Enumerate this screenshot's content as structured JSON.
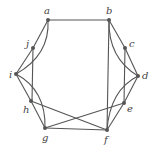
{
  "graph": {
    "vertices": [
      {
        "id": "a",
        "label": "a",
        "x": 48,
        "y": 20,
        "lx": 44,
        "ly": 14
      },
      {
        "id": "b",
        "label": "b",
        "x": 109,
        "y": 20,
        "lx": 106,
        "ly": 14
      },
      {
        "id": "c",
        "label": "c",
        "x": 125,
        "y": 48,
        "lx": 129,
        "ly": 47
      },
      {
        "id": "d",
        "label": "d",
        "x": 138,
        "y": 76,
        "lx": 142,
        "ly": 79
      },
      {
        "id": "e",
        "label": "e",
        "x": 124,
        "y": 103,
        "lx": 127,
        "ly": 112
      },
      {
        "id": "f",
        "label": "f",
        "x": 107,
        "y": 130,
        "lx": 104,
        "ly": 143
      },
      {
        "id": "g",
        "label": "g",
        "x": 45,
        "y": 128,
        "lx": 42,
        "ly": 141
      },
      {
        "id": "h",
        "label": "h",
        "x": 31,
        "y": 101,
        "lx": 23,
        "ly": 113
      },
      {
        "id": "i",
        "label": "i",
        "x": 16,
        "y": 74,
        "lx": 9,
        "ly": 78
      },
      {
        "id": "j",
        "label": "j",
        "x": 33,
        "y": 48,
        "lx": 26,
        "ly": 47
      }
    ],
    "edges": [
      {
        "from": "a",
        "to": "b",
        "type": "line"
      },
      {
        "from": "a",
        "to": "j",
        "type": "line"
      },
      {
        "from": "a",
        "to": "i",
        "type": "curve"
      },
      {
        "from": "j",
        "to": "i",
        "type": "line"
      },
      {
        "from": "j",
        "to": "h",
        "type": "line"
      },
      {
        "from": "i",
        "to": "h",
        "type": "line"
      },
      {
        "from": "i",
        "to": "g",
        "type": "curve"
      },
      {
        "from": "h",
        "to": "g",
        "type": "line"
      },
      {
        "from": "h",
        "to": "f",
        "type": "line"
      },
      {
        "from": "g",
        "to": "f",
        "type": "line"
      },
      {
        "from": "g",
        "to": "e",
        "type": "line"
      },
      {
        "from": "b",
        "to": "c",
        "type": "line"
      },
      {
        "from": "b",
        "to": "d",
        "type": "curve"
      },
      {
        "from": "b",
        "to": "f",
        "type": "line"
      },
      {
        "from": "c",
        "to": "d",
        "type": "line"
      },
      {
        "from": "c",
        "to": "e",
        "type": "line"
      },
      {
        "from": "d",
        "to": "e",
        "type": "line"
      },
      {
        "from": "d",
        "to": "f",
        "type": "curve"
      },
      {
        "from": "e",
        "to": "f",
        "type": "line"
      }
    ]
  }
}
